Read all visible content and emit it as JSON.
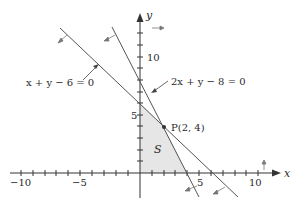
{
  "figure": {
    "axes": {
      "x_label": "x",
      "y_label": "y",
      "x_ticks": [
        "−10",
        "−5",
        "5",
        "10"
      ],
      "y_ticks": [
        "5",
        "10"
      ],
      "x_range": [
        -10.5,
        12
      ],
      "y_range": [
        -2,
        13
      ]
    },
    "lines": [
      {
        "equation": "x + y − 6 = 0",
        "label": "x + y − 6 = 0"
      },
      {
        "equation": "2x + y − 8 = 0",
        "label": "2x + y − 8 = 0"
      }
    ],
    "point": {
      "name": "P",
      "coords": "(2, 4)",
      "label": "P(2, 4)"
    },
    "region": {
      "label": "S",
      "vertices": [
        [
          0,
          0
        ],
        [
          4,
          0
        ],
        [
          2,
          4
        ],
        [
          0,
          6
        ]
      ]
    },
    "colors": {
      "line": "#555555",
      "region_fill": "#e6e6e6",
      "axis": "#333333"
    }
  }
}
